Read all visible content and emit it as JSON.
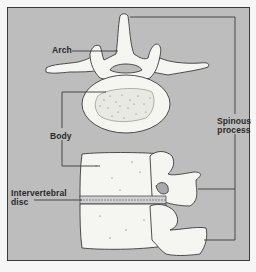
{
  "figure": {
    "colors": {
      "panel_bg": "#bdbdbd",
      "border": "#3a3a3a",
      "bone_fill": "#f5f5f2",
      "bone_outline": "#3c3c3c",
      "leader_line": "#3a3a3a",
      "label_text": "#2a2a2a"
    },
    "views": [
      {
        "name": "top-view",
        "description": "Superior view of a single vertebra showing arch, transverse processes and vertebral body"
      },
      {
        "name": "side-view",
        "description": "Lateral view of two stacked vertebrae with intervertebral disc"
      }
    ],
    "labels": {
      "arch": "Arch",
      "body": "Body",
      "disc_line1": "Intervertebral",
      "disc_line2": "disc",
      "spinous_line1": "Spinous",
      "spinous_line2": "process"
    }
  }
}
